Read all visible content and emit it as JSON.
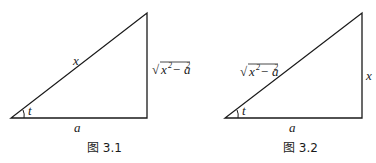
{
  "figures": [
    {
      "caption": "图 3.1",
      "hypotenuse_label": "x",
      "vertical_label": "√x² − a²",
      "vertical_label_base": "x",
      "vertical_label_sup": "2",
      "vertical_label_mid": " − a",
      "vertical_label_sup2": "2",
      "base_label": "a",
      "angle_label": "t"
    },
    {
      "caption": "图 3.2",
      "hypotenuse_label": "√x² − a²",
      "hyp_label_base": "x",
      "hyp_label_sup": "2",
      "hyp_label_mid": " − a",
      "hyp_label_sup2": "2",
      "vertical_label": "x",
      "base_label": "a",
      "angle_label": "t"
    }
  ],
  "colors": {
    "line": "#1a1a1a",
    "background": "#ffffff"
  }
}
